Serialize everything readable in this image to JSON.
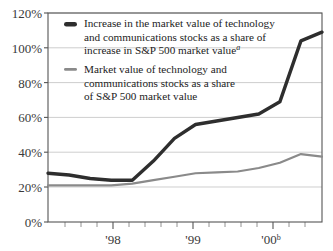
{
  "chart_data": {
    "type": "line",
    "title": "",
    "xlabel": "",
    "ylabel": "",
    "ylim": [
      0,
      120
    ],
    "ytick_labels": [
      "0%",
      "20%",
      "40%",
      "60%",
      "80%",
      "100%",
      "120%"
    ],
    "ytick_values": [
      0,
      20,
      40,
      60,
      80,
      100,
      120
    ],
    "xtick_labels": [
      "'98",
      "'99",
      "'00"
    ],
    "xtick_superscripts": [
      "",
      "",
      "b"
    ],
    "xtick_values": [
      1998,
      1999,
      2000
    ],
    "x_minor_ticks_per_year": 5,
    "grid": "horizontal",
    "legend_position": "upper-left-inside",
    "x": [
      1997.6,
      1997.8,
      1998.0,
      1998.2,
      1998.4,
      1998.6,
      1998.8,
      1999.0,
      1999.2,
      1999.4,
      1999.6,
      1999.8,
      2000.0,
      2000.2
    ],
    "series": [
      {
        "name": "Increase in the market value of technology and communications stocks as a share of increase in S&P 500 market value",
        "superscript": "a",
        "color": "#2e2e2e",
        "values": [
          28,
          27,
          25,
          24,
          24,
          35,
          48,
          56,
          58,
          60,
          62,
          69,
          104,
          109
        ]
      },
      {
        "name": "Market value of technology and communications stocks as a share of S&P 500 market value",
        "superscript": "",
        "color": "#8a8a8a",
        "values": [
          21,
          21,
          21,
          21,
          22,
          24,
          26,
          28,
          28.5,
          29,
          31,
          34,
          39,
          37.5
        ]
      }
    ]
  },
  "legend": {
    "entries": [
      {
        "swatch": "dark-line-swatch",
        "lines": [
          "Increase in the market value of technology",
          "and communications stocks as a share of",
          "increase in S&P 500 market value"
        ],
        "superscript": "a"
      },
      {
        "swatch": "gray-line-swatch",
        "lines": [
          "Market value of technology and",
          "communications stocks as a share",
          "of S&P 500 market value"
        ],
        "superscript": ""
      }
    ]
  },
  "colors": {
    "series_dark": "#2e2e2e",
    "series_gray": "#8a8a8a",
    "gridline": "#b9b9b9",
    "frame": "#555555",
    "background": "#ffffff"
  }
}
